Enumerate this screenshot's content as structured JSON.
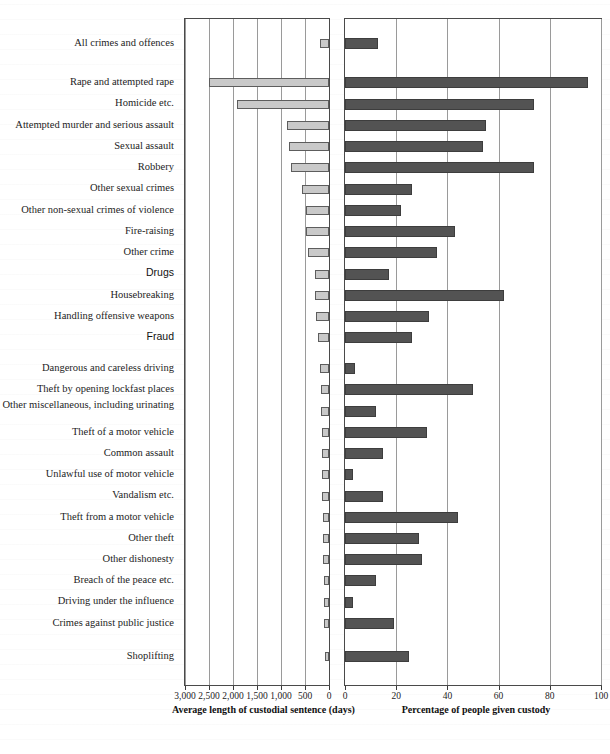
{
  "chart_data": {
    "type": "bar",
    "title": "",
    "subtitle": "",
    "orientation": "horizontal",
    "layout": "back-to-back butterfly, two panels sharing category axis",
    "grid": true,
    "legend": "none",
    "categories": [
      "All crimes and offences",
      "Rape and attempted rape",
      "Homicide etc.",
      "Attempted murder and serious assault",
      "Sexual assault",
      "Robbery",
      "Other sexual crimes",
      "Other non-sexual crimes of violence",
      "Fire-raising",
      "Other crime",
      "Drugs",
      "Housebreaking",
      "Handling offensive weapons",
      "Fraud",
      "Dangerous and careless driving",
      "Theft by opening lockfast places",
      "Other miscellaneous, including urinating",
      "Theft of a motor vehicle",
      "Common assault",
      "Unlawful use of motor vehicle",
      "Vandalism etc.",
      "Theft from a motor vehicle",
      "Other theft",
      "Other dishonesty",
      "Breach of the peace etc.",
      "Driving under the influence",
      "Crimes against public justice",
      "Shoplifting"
    ],
    "panels": [
      {
        "id": "left",
        "xlabel": "Average length of custodial sentence (days)",
        "xlim": [
          3000,
          0
        ],
        "reversed": true,
        "ticks": [
          3000,
          2500,
          2000,
          1500,
          1000,
          500,
          0
        ],
        "tick_labels": [
          "3,000",
          "2,500",
          "2,000",
          "1,500",
          "1,000",
          "500",
          "0"
        ],
        "bar_fill": "#c9c9c9",
        "bar_stroke": "#5d5d5d",
        "values": [
          190,
          2510,
          1910,
          880,
          840,
          790,
          560,
          480,
          470,
          430,
          300,
          290,
          275,
          230,
          195,
          170,
          160,
          155,
          150,
          145,
          140,
          135,
          125,
          120,
          110,
          100,
          95,
          90
        ]
      },
      {
        "id": "right",
        "xlabel": "Percentage of people given custody",
        "xlim": [
          0,
          100
        ],
        "reversed": false,
        "ticks": [
          0,
          20,
          40,
          60,
          80,
          100
        ],
        "tick_labels": [
          "0",
          "20",
          "40",
          "60",
          "80",
          "100"
        ],
        "bar_fill": "#535353",
        "bar_stroke": "#3d3d3d",
        "values": [
          13,
          95,
          74,
          55,
          54,
          74,
          26,
          22,
          43,
          36,
          17,
          62,
          33,
          26,
          4,
          50,
          12,
          32,
          15,
          3,
          15,
          44,
          29,
          30,
          12,
          3,
          19,
          25
        ]
      }
    ]
  },
  "styling": {
    "serif_labels_font": "serif",
    "sans_labels": [
      "Drugs",
      "Fraud"
    ],
    "two_line_labels": [
      "Other miscellaneous, including urinating"
    ],
    "axis_color": "#4a4a4a",
    "grid_color": "#9a9a9a",
    "text_color": "#1d1d1d"
  }
}
